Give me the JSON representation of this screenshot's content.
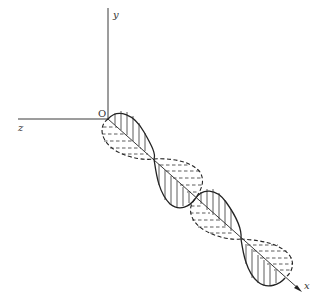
{
  "diagram": {
    "axes": {
      "y_label": "y",
      "z_label": "z",
      "x_label": "x",
      "origin_label": "O"
    },
    "colors": {
      "line": "#222222",
      "background": "#ffffff"
    }
  }
}
